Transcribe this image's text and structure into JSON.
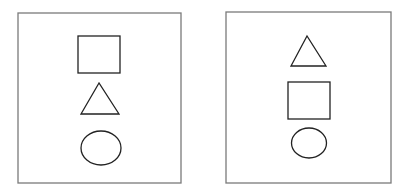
{
  "colors": {
    "background": "#ffffff",
    "frame_stroke": "#7a7a7a",
    "shape_stroke": "#222222"
  },
  "panels": [
    {
      "name": "panel-left",
      "frame": {
        "x": 18,
        "y": 13,
        "width": 163,
        "height": 170
      },
      "shapes": [
        {
          "type": "square",
          "x": 78,
          "y": 36,
          "width": 42,
          "height": 37
        },
        {
          "type": "triangle",
          "points": [
            [
              99,
              83
            ],
            [
              81,
              114
            ],
            [
              119,
              114
            ]
          ]
        },
        {
          "type": "ellipse",
          "cx": 101,
          "cy": 148,
          "rx": 20,
          "ry": 17
        }
      ]
    },
    {
      "name": "panel-right",
      "frame": {
        "x": 226,
        "y": 12,
        "width": 165,
        "height": 171
      },
      "shapes": [
        {
          "type": "triangle",
          "points": [
            [
              307,
              36
            ],
            [
              291,
              66
            ],
            [
              326,
              66
            ]
          ]
        },
        {
          "type": "square",
          "x": 288,
          "y": 82,
          "width": 42,
          "height": 37
        },
        {
          "type": "ellipse",
          "cx": 309,
          "cy": 143,
          "rx": 17.5,
          "ry": 15
        }
      ]
    }
  ]
}
